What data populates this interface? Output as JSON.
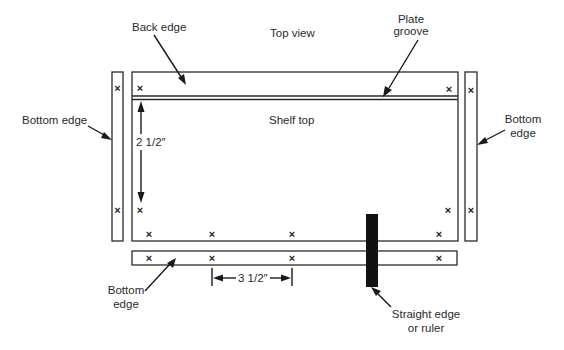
{
  "diagram": {
    "title": "Top view",
    "labels": {
      "back_edge": "Back edge",
      "plate_groove_line1": "Plate",
      "plate_groove_line2": "groove",
      "shelf_top": "Shelf top",
      "bottom_edge_left": "Bottom edge",
      "bottom_edge_right_line1": "Bottom",
      "bottom_edge_right_line2": "edge",
      "bottom_edge_lower_line1": "Bottom",
      "bottom_edge_lower_line2": "edge",
      "straight_edge_line1": "Straight edge",
      "straight_edge_line2": "or ruler"
    },
    "dimensions": {
      "vertical": "2 1/2″",
      "horizontal": "3 1/2″"
    },
    "mark_glyph": "×",
    "colors": {
      "line": "#2a2a2a",
      "ruler": "#111111",
      "background": "#ffffff"
    }
  }
}
